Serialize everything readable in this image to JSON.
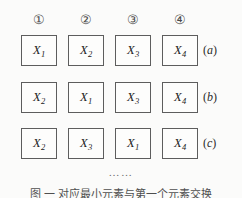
{
  "figure": {
    "background_color": "#fbfbfa",
    "box_border_color": "#5d5d5d",
    "continuation_marker": "……",
    "caption": "图  一  对应最小元素与第一个元素交换",
    "column_indices": [
      {
        "label": "①",
        "name": "column-index-1"
      },
      {
        "label": "②",
        "name": "column-index-2"
      },
      {
        "label": "③",
        "name": "column-index-3"
      },
      {
        "label": "④",
        "name": "column-index-4"
      }
    ],
    "rows": [
      {
        "tag_open": "(",
        "tag_letter": "a",
        "tag_close": ")",
        "cells": [
          {
            "symbol": "X",
            "subscript": "1"
          },
          {
            "symbol": "X",
            "subscript": "2"
          },
          {
            "symbol": "X",
            "subscript": "3"
          },
          {
            "symbol": "X",
            "subscript": "4"
          }
        ]
      },
      {
        "tag_open": "(",
        "tag_letter": "b",
        "tag_close": ")",
        "cells": [
          {
            "symbol": "X",
            "subscript": "2"
          },
          {
            "symbol": "X",
            "subscript": "1"
          },
          {
            "symbol": "X",
            "subscript": "3"
          },
          {
            "symbol": "X",
            "subscript": "4"
          }
        ]
      },
      {
        "tag_open": "(",
        "tag_letter": "c",
        "tag_close": ")",
        "cells": [
          {
            "symbol": "X",
            "subscript": "2"
          },
          {
            "symbol": "X",
            "subscript": "3"
          },
          {
            "symbol": "X",
            "subscript": "1"
          },
          {
            "symbol": "X",
            "subscript": "4"
          }
        ]
      }
    ]
  }
}
